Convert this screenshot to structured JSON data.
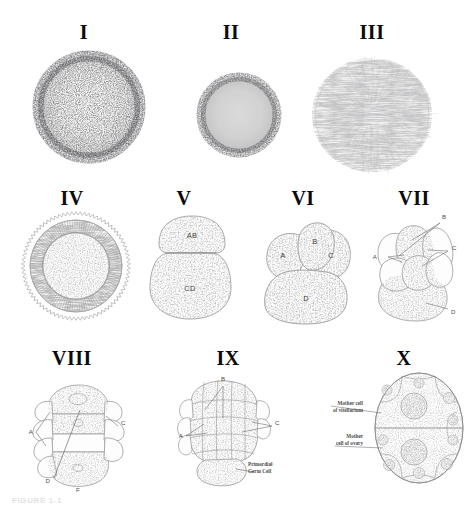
{
  "figure": {
    "title_caption": "FIGURE 1-1",
    "background_color": "#ffffff",
    "ink_color": "#6b6b6b",
    "numeral_color": "#0b0b0b",
    "label_color": "#4e4e4e"
  },
  "panels": [
    {
      "numeral": "I",
      "kind": "stippled-ovum",
      "description": "unfertilized ovum, dense stipple",
      "labels": []
    },
    {
      "numeral": "II",
      "kind": "stippled-ovum",
      "description": "contracted ovum, dense stipple",
      "labels": []
    },
    {
      "numeral": "III",
      "kind": "radiate-ovum",
      "description": "ovum with radial striations",
      "labels": []
    },
    {
      "numeral": "IV",
      "kind": "membrane-ovum",
      "description": "ovum with crenulated membrane and radial band",
      "labels": []
    },
    {
      "numeral": "V",
      "kind": "two-cell",
      "description": "two-cell stage",
      "labels": [
        "AB",
        "CD"
      ]
    },
    {
      "numeral": "VI",
      "kind": "four-cell",
      "description": "four-cell stage",
      "labels": [
        "A",
        "B",
        "C",
        "D"
      ]
    },
    {
      "numeral": "VII",
      "kind": "multi-cell",
      "description": "early cleavage, leader lines",
      "labels": [
        "A",
        "B",
        "C",
        "D"
      ]
    },
    {
      "numeral": "VIII",
      "kind": "elongated-embryo",
      "description": "elongated tiered embryo",
      "labels": [
        "A",
        "C",
        "D",
        "F"
      ]
    },
    {
      "numeral": "IX",
      "kind": "morula",
      "description": "morula with primordial germ cell",
      "labels": [
        "A",
        "B",
        "C"
      ],
      "annotations": [
        "Primordial\nGerm Cell"
      ]
    },
    {
      "numeral": "X",
      "kind": "gonad-section",
      "description": "section showing mother cells",
      "labels": [],
      "annotations": [
        "Mother cell\nof vitellarium",
        "Mother\ncell of ovary"
      ]
    }
  ],
  "annotations": {
    "primordial_germ_cell": "Primordial\nGerm Cell",
    "mother_cell_vitellarium": "Mother cell\nof vitellarium",
    "mother_cell_ovary": "Mother\ncell of ovary"
  },
  "panel_v_labels": {
    "ab": "AB",
    "cd": "CD"
  },
  "panel_vi_labels": {
    "a": "A",
    "b": "B",
    "c": "C",
    "d": "D"
  },
  "panel_vii_labels": {
    "a": "A",
    "b": "B",
    "c": "C",
    "d": "D"
  },
  "panel_viii_labels": {
    "a": "A",
    "c": "C",
    "d": "D",
    "f": "F"
  },
  "panel_ix_labels": {
    "a": "A",
    "b": "B",
    "c": "C"
  }
}
